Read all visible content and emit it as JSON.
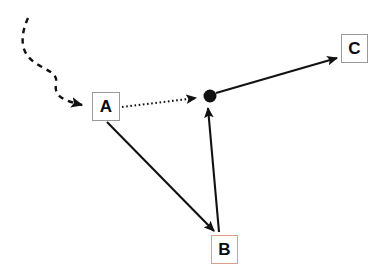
{
  "diagram": {
    "background_color": "#ffffff",
    "stroke_color": "#111111",
    "nodes": [
      {
        "id": "a",
        "label": "A",
        "border_color": "#9a9a9a",
        "x": 92,
        "y": 92,
        "w": 28,
        "h": 29
      },
      {
        "id": "b",
        "label": "B",
        "border_color": "#e09c86",
        "x": 211,
        "y": 235,
        "w": 27,
        "h": 29
      },
      {
        "id": "c",
        "label": "C",
        "border_color": "#9a9a9a",
        "x": 341,
        "y": 34,
        "w": 27,
        "h": 29
      }
    ],
    "junction": {
      "name": "junction-dot",
      "color": "#111111",
      "cx": 210,
      "cy": 96,
      "r": 6.5
    },
    "edges": [
      {
        "id": "inbound-dashed",
        "style": "dashed",
        "from": "curve-origin",
        "to": "a",
        "arrowhead": true,
        "path": "M 28 18 C 20 36, 20 52, 34 62 C 48 72, 58 72, 56 84 C 54 96, 62 100, 82 105"
      },
      {
        "id": "a-to-junction",
        "style": "dotted",
        "from": "a",
        "to": "junction",
        "arrowhead": true,
        "path": "M 122 107 L 196 98"
      },
      {
        "id": "a-to-b",
        "style": "solid",
        "from": "a",
        "to": "b",
        "arrowhead": true,
        "path": "M 107 122 L 214 231"
      },
      {
        "id": "b-to-junction",
        "style": "solid",
        "from": "b",
        "to": "junction",
        "arrowhead": true,
        "path": "M 219 232 L 208 108"
      },
      {
        "id": "junction-to-c",
        "style": "solid",
        "from": "junction",
        "to": "c",
        "arrowhead": true,
        "path": "M 216 93 L 337 58"
      }
    ]
  }
}
